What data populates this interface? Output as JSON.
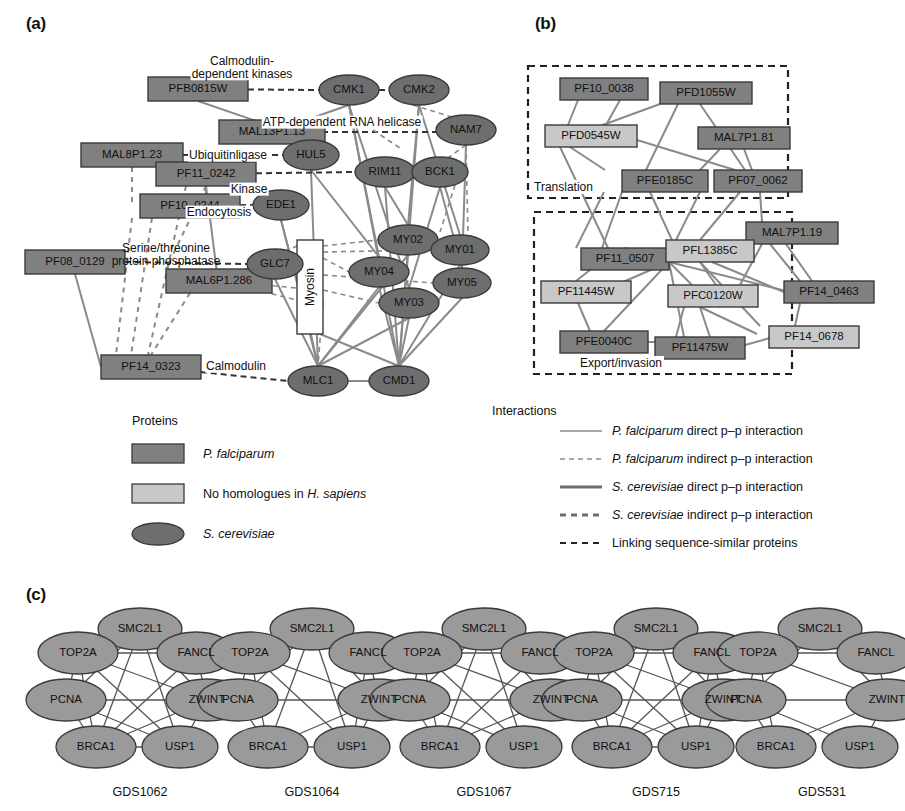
{
  "figure": {
    "panels": [
      {
        "id": "a",
        "letter": "(a)"
      },
      {
        "id": "b",
        "letter": "(b)"
      },
      {
        "id": "c",
        "letter": "(c)"
      }
    ]
  },
  "colors": {
    "pf_dark": "#7d7d7d",
    "pf_light": "#c8c8c8",
    "yeast": "#6e6e6e",
    "edge_gray": "#8a8a8a",
    "stroke_dark": "#3a3a3a",
    "text": "#111111",
    "white": "#ffffff"
  },
  "panel_a": {
    "letter": "(a)",
    "rect_nodes": [
      {
        "id": "PFB0815W",
        "label": "PFB0815W",
        "x": 148,
        "y": 89,
        "w": 100,
        "h": 24,
        "fill": "pf_dark"
      },
      {
        "id": "MAL13P1.13",
        "label": "MAL13P1.13",
        "x": 219,
        "y": 132,
        "w": 106,
        "h": 24,
        "fill": "pf_dark"
      },
      {
        "id": "MAL8P1.23",
        "label": "MAL8P1.23",
        "x": 81,
        "y": 155,
        "w": 102,
        "h": 24,
        "fill": "pf_dark"
      },
      {
        "id": "PF11_0242",
        "label": "PF11_0242",
        "x": 156,
        "y": 174,
        "w": 100,
        "h": 24,
        "fill": "pf_dark"
      },
      {
        "id": "PF10_0244",
        "label": "PF10_0244",
        "x": 140,
        "y": 206,
        "w": 100,
        "h": 24,
        "fill": "pf_dark"
      },
      {
        "id": "PF08_0129",
        "label": "PF08_0129",
        "x": 25,
        "y": 262,
        "w": 100,
        "h": 24,
        "fill": "pf_dark"
      },
      {
        "id": "MAL6P1.286",
        "label": "MAL6P1.286",
        "x": 166,
        "y": 281,
        "w": 106,
        "h": 24,
        "fill": "pf_dark"
      },
      {
        "id": "PF14_0323",
        "label": "PF14_0323",
        "x": 101,
        "y": 367,
        "w": 100,
        "h": 24,
        "fill": "pf_dark"
      },
      {
        "id": "Myosin",
        "label": "Myosin",
        "x": 310,
        "y": 240,
        "w": 26,
        "h": 90,
        "fill": "white",
        "vertical": true
      }
    ],
    "ellipse_nodes": [
      {
        "id": "CMK1",
        "label": "CMK1",
        "cx": 349,
        "cy": 90,
        "rx": 30,
        "ry": 15
      },
      {
        "id": "CMK2",
        "label": "CMK2",
        "cx": 419,
        "cy": 90,
        "rx": 30,
        "ry": 15
      },
      {
        "id": "NAM7",
        "label": "NAM7",
        "cx": 466,
        "cy": 130,
        "rx": 30,
        "ry": 15
      },
      {
        "id": "HUL5",
        "label": "HUL5",
        "cx": 311,
        "cy": 155,
        "rx": 28,
        "ry": 15
      },
      {
        "id": "RIM11",
        "label": "RIM11",
        "cx": 385,
        "cy": 172,
        "rx": 30,
        "ry": 15
      },
      {
        "id": "BCK1",
        "label": "BCK1",
        "cx": 440,
        "cy": 172,
        "rx": 28,
        "ry": 15
      },
      {
        "id": "EDE1",
        "label": "EDE1",
        "cx": 281,
        "cy": 205,
        "rx": 28,
        "ry": 15
      },
      {
        "id": "GLC7",
        "label": "GLC7",
        "cx": 275,
        "cy": 264,
        "rx": 28,
        "ry": 15
      },
      {
        "id": "MY02",
        "label": "MY02",
        "cx": 408,
        "cy": 240,
        "rx": 30,
        "ry": 15
      },
      {
        "id": "MY01",
        "label": "MY01",
        "cx": 460,
        "cy": 250,
        "rx": 29,
        "ry": 15
      },
      {
        "id": "MY04",
        "label": "MY04",
        "cx": 379,
        "cy": 272,
        "rx": 30,
        "ry": 15
      },
      {
        "id": "MY05",
        "label": "MY05",
        "cx": 462,
        "cy": 283,
        "rx": 29,
        "ry": 15
      },
      {
        "id": "MY03",
        "label": "MY03",
        "cx": 409,
        "cy": 303,
        "rx": 30,
        "ry": 15
      },
      {
        "id": "MLC1",
        "label": "MLC1",
        "cx": 318,
        "cy": 381,
        "rx": 30,
        "ry": 15
      },
      {
        "id": "CMD1",
        "label": "CMD1",
        "cx": 399,
        "cy": 381,
        "rx": 30,
        "ry": 15
      }
    ],
    "edge_labels": [
      {
        "id": "calmodulin-dependent-kinases",
        "text": "Calmodulin-\ndependent kinases",
        "x": 242,
        "y": 68
      },
      {
        "id": "atp-dependent-rna-helicase",
        "text": "ATP-dependent RNA helicase",
        "x": 342,
        "y": 122
      },
      {
        "id": "ubiquitinligase",
        "text": "Ubiquitinligase",
        "x": 228,
        "y": 155
      },
      {
        "id": "kinase",
        "text": "Kinase",
        "x": 249,
        "y": 189
      },
      {
        "id": "endocytosis",
        "text": "Endocytosis",
        "x": 219,
        "y": 212
      },
      {
        "id": "serine-threonine-protein-phosphatase",
        "text": "Serine/threonine\nprotein phosphatase",
        "x": 166,
        "y": 255
      },
      {
        "id": "calmodulin",
        "text": "Calmodulin",
        "x": 236,
        "y": 366
      }
    ],
    "legend": {
      "title": "Proteins",
      "items": [
        {
          "id": "p-falciparum",
          "shape": "rect",
          "fill": "pf_dark",
          "text": "P. falciparum",
          "italic_prefix": "P. falciparum",
          "suffix": ""
        },
        {
          "id": "no-homologues",
          "shape": "rect",
          "fill": "pf_light",
          "text": "No homologues in H. sapiens",
          "italic_prefix": "",
          "suffix": ""
        },
        {
          "id": "s-cerevisiae",
          "shape": "ellipse",
          "fill": "yeast",
          "text": "S. cerevisiae",
          "italic_prefix": "S. cerevisiae",
          "suffix": ""
        }
      ]
    }
  },
  "panel_b": {
    "letter": "(b)",
    "groups": [
      {
        "id": "translation",
        "label": "Translation",
        "x": 528,
        "y": 66,
        "w": 260,
        "h": 132
      },
      {
        "id": "export-invasion",
        "label": "Export/invasion",
        "x": 534,
        "y": 212,
        "w": 258,
        "h": 162
      }
    ],
    "rect_nodes": [
      {
        "id": "PF10_0038",
        "label": "PF10_0038",
        "x": 560,
        "y": 78,
        "w": 88,
        "h": 22,
        "fill": "pf_dark"
      },
      {
        "id": "PFD1055W",
        "label": "PFD1055W",
        "x": 660,
        "y": 82,
        "w": 92,
        "h": 22,
        "fill": "pf_dark"
      },
      {
        "id": "PFD0545W",
        "label": "PFD0545W",
        "x": 545,
        "y": 125,
        "w": 92,
        "h": 22,
        "fill": "pf_light"
      },
      {
        "id": "MAL7P1.81",
        "label": "MAL7P1.81",
        "x": 698,
        "y": 127,
        "w": 92,
        "h": 22,
        "fill": "pf_dark"
      },
      {
        "id": "PFE0185C",
        "label": "PFE0185C",
        "x": 622,
        "y": 170,
        "w": 86,
        "h": 22,
        "fill": "pf_dark"
      },
      {
        "id": "PF07_0062",
        "label": "PF07_0062",
        "x": 714,
        "y": 170,
        "w": 88,
        "h": 22,
        "fill": "pf_dark"
      },
      {
        "id": "MAL7P1.19",
        "label": "MAL7P1.19",
        "x": 746,
        "y": 222,
        "w": 92,
        "h": 22,
        "fill": "pf_dark"
      },
      {
        "id": "PF11_0507",
        "label": "PF11_0507",
        "x": 581,
        "y": 248,
        "w": 88,
        "h": 22,
        "fill": "pf_dark"
      },
      {
        "id": "PFL1385C",
        "label": "PFL1385C",
        "x": 666,
        "y": 240,
        "w": 88,
        "h": 22,
        "fill": "pf_light"
      },
      {
        "id": "PF11445W",
        "label": "PF11445W",
        "x": 541,
        "y": 281,
        "w": 90,
        "h": 22,
        "fill": "pf_light"
      },
      {
        "id": "PFC0120W",
        "label": "PFC0120W",
        "x": 668,
        "y": 285,
        "w": 90,
        "h": 22,
        "fill": "pf_light"
      },
      {
        "id": "PF14_0463",
        "label": "PF14_0463",
        "x": 784,
        "y": 281,
        "w": 90,
        "h": 22,
        "fill": "pf_dark"
      },
      {
        "id": "PFE0040C",
        "label": "PFE0040C",
        "x": 560,
        "y": 331,
        "w": 88,
        "h": 22,
        "fill": "pf_dark"
      },
      {
        "id": "PF11475W",
        "label": "PF11475W",
        "x": 655,
        "y": 337,
        "w": 90,
        "h": 22,
        "fill": "pf_dark"
      },
      {
        "id": "PF14_0678",
        "label": "PF14_0678",
        "x": 769,
        "y": 326,
        "w": 90,
        "h": 22,
        "fill": "pf_light"
      }
    ],
    "legend": {
      "title": "Interactions",
      "items": [
        {
          "id": "pf-direct",
          "style": "solid-thin",
          "text": "P. falciparum direct p–p interaction",
          "italic": "P. falciparum",
          "rest": " direct p–p interaction"
        },
        {
          "id": "pf-indirect",
          "style": "dashed-thin",
          "text": "P. falciparum indirect p–p interaction",
          "italic": "P. falciparum",
          "rest": " indirect p–p interaction"
        },
        {
          "id": "sc-direct",
          "style": "solid-thick",
          "text": "S. cerevisiae direct p–p interaction",
          "italic": "S. cerevisiae",
          "rest": " direct p–p interaction"
        },
        {
          "id": "sc-indirect",
          "style": "dashed-thick",
          "text": "S. cerevisiae indirect p–p interaction",
          "italic": "S. cerevisiae",
          "rest": " indirect p–p interaction"
        },
        {
          "id": "linking",
          "style": "dashed-black",
          "text": "Linking sequence-similar proteins",
          "italic": "",
          "rest": "Linking sequence-similar proteins"
        }
      ]
    }
  },
  "panel_c": {
    "letter": "(c)",
    "node_names": [
      "SMC2L1",
      "TOP2A",
      "FANCL",
      "PCNA",
      "ZWINT",
      "BRCA1",
      "USP1"
    ],
    "networks": [
      {
        "id": "GDS1062",
        "label": "GDS1062",
        "cx": 140
      },
      {
        "id": "GDS1064",
        "label": "GDS1064",
        "cx": 312
      },
      {
        "id": "GDS1067",
        "label": "GDS1067",
        "cx": 484
      },
      {
        "id": "GDS715",
        "label": "GDS715",
        "cx": 656
      },
      {
        "id": "GDS531",
        "label": "GDS531",
        "cx": 820
      }
    ]
  }
}
